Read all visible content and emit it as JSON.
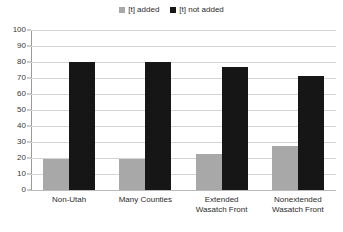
{
  "chart_data": {
    "type": "bar",
    "title": "",
    "xlabel": "",
    "ylabel": "",
    "ylim": [
      0,
      100
    ],
    "ytick_step": 10,
    "ytick_labels": [
      "100",
      "90",
      "80",
      "70",
      "60",
      "50",
      "40",
      "30",
      "20",
      "10",
      "0"
    ],
    "ytick_values": [
      100,
      90,
      80,
      70,
      60,
      50,
      40,
      30,
      20,
      10,
      0
    ],
    "grid": true,
    "grid_axis": "y",
    "legend_position": "top-center",
    "categories": [
      "Non-Utah",
      "Many Counties",
      "Extended\nWasatch Front",
      "Nonextended\nWasatch Front"
    ],
    "series": [
      {
        "name": "[t] added",
        "color": "#a8a8a8",
        "values": [
          19.5,
          19.5,
          22.5,
          27.5
        ]
      },
      {
        "name": "[t] not added",
        "color": "#161616",
        "values": [
          80,
          80,
          77,
          71.5
        ]
      }
    ]
  },
  "legend": {
    "items": [
      {
        "label": "[t] added",
        "color": "#a8a8a8",
        "icon": "square-swatch-icon"
      },
      {
        "label": "[t] not added",
        "color": "#161616",
        "icon": "square-swatch-icon"
      }
    ]
  },
  "colors": {
    "added": "#a8a8a8",
    "not_added": "#161616",
    "gridline": "#d4d4d4",
    "axis": "#9a9a9a",
    "text": "#2b2b2b",
    "background": "#ffffff"
  }
}
